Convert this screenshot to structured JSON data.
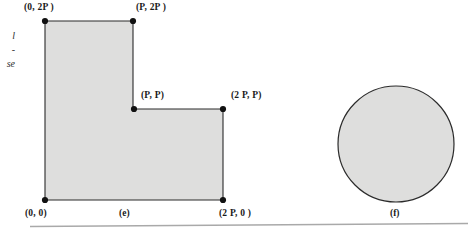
{
  "page": {
    "background": "#ffffff",
    "width": 468,
    "height": 236
  },
  "figure_e": {
    "caption": "(e)",
    "shape": "L-shaped-polygon",
    "fill": "#dededd",
    "stroke": "#2b2b2b",
    "vertex_labels": {
      "top_left": "(0, 2P )",
      "top_right": "(P, 2P )",
      "inner_corner": "(P, P)",
      "right": "(2 P, P)",
      "bottom_left": "(0, 0)",
      "bottom_right": "(2 P, 0 )"
    },
    "vertices_px": [
      {
        "name": "(0, 2P )",
        "x": 45,
        "y": 21
      },
      {
        "name": "(P, 2P )",
        "x": 133,
        "y": 21
      },
      {
        "name": "(P, P)",
        "x": 134,
        "y": 109
      },
      {
        "name": "(2 P, P)",
        "x": 223,
        "y": 109
      },
      {
        "name": "(2 P, 0 )",
        "x": 223,
        "y": 200
      },
      {
        "name": "(0, 0)",
        "x": 45,
        "y": 200
      }
    ]
  },
  "figure_f": {
    "caption": "(f)",
    "shape": "circle",
    "fill": "#dededd",
    "stroke": "#2b2b2b",
    "center_px": {
      "x": 396,
      "y": 144
    },
    "radius_px": 58
  },
  "margin_notes": {
    "fragment_1": "l",
    "fragment_2": "-",
    "fragment_3": "se"
  },
  "rule": {
    "name": "page-rule",
    "color": "#a9a9a9"
  }
}
